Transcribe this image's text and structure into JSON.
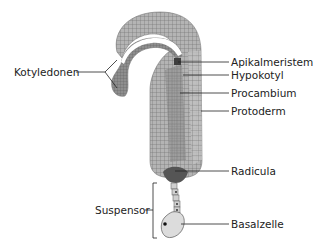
{
  "diagram": {
    "labels": {
      "kotyledonen": "Kotyledonen",
      "apikalmeristem": "Apikalmeristem",
      "hypokotyl": "Hypokotyl",
      "procambium": "Procambium",
      "protoderm": "Protoderm",
      "radicula": "Radicula",
      "suspensor": "Suspensor",
      "basalzelle": "Basalzelle"
    },
    "colors": {
      "tissue_light": "#b8b8b8",
      "tissue_mid": "#9a9a9a",
      "tissue_dark": "#6e6e6e",
      "meristem": "#4a4a4a",
      "cell_line": "#555555",
      "basal_cell": "#dcdcdc",
      "leader_line": "#222222",
      "text": "#222222"
    }
  }
}
